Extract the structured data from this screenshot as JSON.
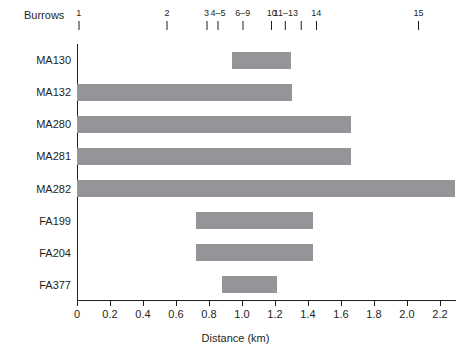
{
  "chart_data": {
    "type": "bar",
    "orientation": "horizontal",
    "title": "",
    "xlabel": "Distance (km)",
    "ylabel": "Animals",
    "xlim": [
      0,
      2.3
    ],
    "ylim": null,
    "grid": false,
    "legend": null,
    "bar_color": "#939598",
    "axis_color": "#231f20",
    "categories": [
      "MA130",
      "MA132",
      "MA280",
      "MA281",
      "MA282",
      "FA199",
      "FA204",
      "FA377"
    ],
    "bars": [
      {
        "category": "MA130",
        "start": 0.94,
        "end": 1.3
      },
      {
        "category": "MA132",
        "start": 0.0,
        "end": 1.3
      },
      {
        "category": "MA280",
        "start": 0.0,
        "end": 1.66
      },
      {
        "category": "MA281",
        "start": 0.0,
        "end": 1.66
      },
      {
        "category": "MA282",
        "start": 0.0,
        "end": 2.29
      },
      {
        "category": "FA199",
        "start": 0.72,
        "end": 1.43
      },
      {
        "category": "FA204",
        "start": 0.72,
        "end": 1.43
      },
      {
        "category": "FA377",
        "start": 0.88,
        "end": 1.21
      }
    ],
    "xticks": [
      {
        "value": 0,
        "label": "0"
      },
      {
        "value": 0.2,
        "label": "0.2"
      },
      {
        "value": 0.4,
        "label": "0.4"
      },
      {
        "value": 0.6,
        "label": "0.6"
      },
      {
        "value": 0.8,
        "label": "0.8"
      },
      {
        "value": 1.0,
        "label": "1.0"
      },
      {
        "value": 1.2,
        "label": "1.2"
      },
      {
        "value": 1.4,
        "label": "1.4"
      },
      {
        "value": 1.6,
        "label": "1.6"
      },
      {
        "value": 1.8,
        "label": "1.8"
      },
      {
        "value": 2.0,
        "label": "2.0"
      },
      {
        "value": 2.2,
        "label": "2.2"
      }
    ],
    "secondary_axis": {
      "title": "Burrows",
      "position": "top",
      "ticks": [
        {
          "label": "1",
          "value": 0.01
        },
        {
          "label": "2",
          "value": 0.545
        },
        {
          "label": "3",
          "value": 0.785
        },
        {
          "label": "4–5",
          "value": 0.855
        },
        {
          "label": "6–9",
          "value": 1.005
        },
        {
          "label": "10",
          "value": 1.18
        },
        {
          "label": "11–13",
          "value": 1.265
        },
        {
          "label": "14",
          "value": 1.45
        },
        {
          "label": "15",
          "value": 2.07
        }
      ],
      "extra_tick_values": [
        1.36
      ]
    }
  }
}
